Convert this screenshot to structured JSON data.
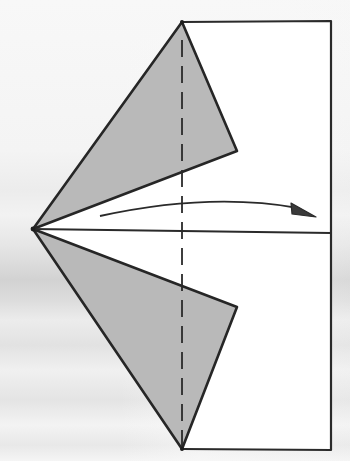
{
  "diagram": {
    "type": "origami-fold-step",
    "colors": {
      "paper_white": "#ffffff",
      "flap_gray": "#b8b8b8",
      "line": "#2a2a2a",
      "background": "#f2f2f2"
    },
    "elements": {
      "paper_rectangle": {
        "x1": 182,
        "y1": 22,
        "x2": 331,
        "y2": 450
      },
      "upper_flap": {
        "points": [
          [
            182,
            22
          ],
          [
            237,
            151
          ],
          [
            33,
            229
          ]
        ]
      },
      "lower_flap": {
        "points": [
          [
            33,
            229
          ],
          [
            237,
            307
          ],
          [
            182,
            449
          ]
        ]
      },
      "upper_white_region": {
        "points": [
          [
            182,
            22
          ],
          [
            331,
            22
          ],
          [
            331,
            233
          ],
          [
            33,
            229
          ],
          [
            237,
            151
          ]
        ]
      },
      "lower_white_region": {
        "points": [
          [
            33,
            229
          ],
          [
            331,
            233
          ],
          [
            331,
            450
          ],
          [
            182,
            449
          ],
          [
            237,
            307
          ]
        ]
      },
      "center_crease": {
        "from": [
          33,
          229
        ],
        "to": [
          331,
          233
        ]
      },
      "valley_fold_line": {
        "x": 182,
        "from_y": 22,
        "to_y": 449,
        "style": "dashed"
      },
      "fold_arrow": {
        "from": [
          100,
          216
        ],
        "control": [
          210,
          195
        ],
        "to": [
          316,
          217
        ],
        "meaning": "fold left point to the right"
      }
    }
  }
}
